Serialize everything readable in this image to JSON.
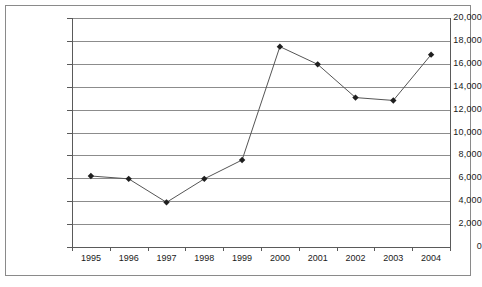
{
  "chart_data": {
    "type": "line",
    "title": "",
    "subtitle": "",
    "xlabel": "",
    "ylabel": "",
    "categories": [
      "1995",
      "1996",
      "1997",
      "1998",
      "1999",
      "2000",
      "2001",
      "2002",
      "2003",
      "2004"
    ],
    "values": [
      6200,
      5950,
      3900,
      5950,
      7600,
      17500,
      15950,
      13050,
      12800,
      16800
    ],
    "series": [
      {
        "name": "",
        "values": [
          6200,
          5950,
          3900,
          5950,
          7600,
          17500,
          15950,
          13050,
          12800,
          16800
        ]
      }
    ],
    "ylim": [
      0,
      20000
    ],
    "ytick_values": [
      0,
      2000,
      4000,
      6000,
      8000,
      10000,
      12000,
      14000,
      16000,
      18000,
      20000
    ],
    "ytick_labels": [
      "0",
      "2,000",
      "4,000",
      "6,000",
      "8,000",
      "10,000",
      "12,000",
      "14,000",
      "16,000",
      "18,000",
      "20,000"
    ],
    "grid": true,
    "grid_axis": "y",
    "legend": false,
    "legend_position": "none",
    "marker": "diamond",
    "annotations": []
  },
  "style": {
    "line_color": "#555555",
    "marker_color": "#1f1f1f",
    "grid_color": "#8c8c8c",
    "axis_color": "#5a5a5a",
    "border_color": "#8a8a8a",
    "background": "#ffffff",
    "text_color": "#1a1a1a"
  }
}
